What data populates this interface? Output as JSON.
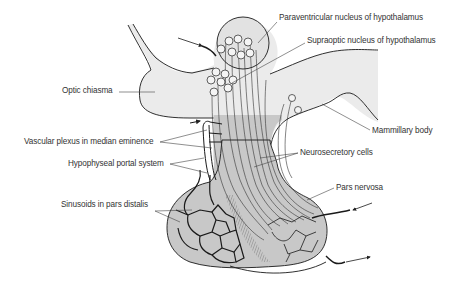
{
  "figure": {
    "colors": {
      "background": "#ffffff",
      "light_tissue": "#ebebeb",
      "dark_tissue": "#c8c8c8",
      "outline": "#1a1a1a",
      "leader": "#444444",
      "text": "#333333"
    },
    "labels": [
      {
        "id": "paraventricular",
        "text": "Paraventricular nucleus of hypothalamus",
        "x": 279,
        "y": 18
      },
      {
        "id": "supraoptic",
        "text": "Supraoptic nucleus of hypothalamus",
        "x": 307,
        "y": 39
      },
      {
        "id": "optic-chiasma",
        "text": "Optic chiasma",
        "x": 62,
        "y": 88
      },
      {
        "id": "mammillary-body",
        "text": "Mammillary body",
        "x": 372,
        "y": 128
      },
      {
        "id": "vascular-plexus",
        "text": "Vascular plexus in median eminence",
        "x": 24,
        "y": 139
      },
      {
        "id": "neurosecretory-cells",
        "text": "Neurosecretory cells",
        "x": 300,
        "y": 149
      },
      {
        "id": "portal-system",
        "text": "Hypophyseal portal system",
        "x": 68,
        "y": 161
      },
      {
        "id": "pars-nervosa",
        "text": "Pars nervosa",
        "x": 336,
        "y": 184
      },
      {
        "id": "sinusoids",
        "text": "Sinusoids in pars distalis",
        "x": 61,
        "y": 202
      }
    ]
  }
}
